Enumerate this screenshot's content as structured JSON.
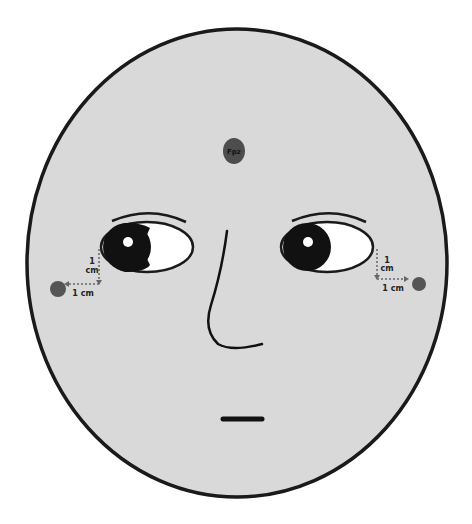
{
  "diagram": {
    "colors": {
      "background": "#ffffff",
      "face_fill": "#d9d9d9",
      "outline": "#1a1a1a",
      "electrode": "#555555",
      "sclera": "#ffffff",
      "iris": "#111111",
      "highlight": "#ffffff",
      "guide_line": "#666666"
    },
    "electrodes": [
      {
        "id": "fpz",
        "label": "Fpz",
        "position": "forehead center"
      },
      {
        "id": "left-outer-canthus",
        "label": "",
        "position": "left of left eye"
      },
      {
        "id": "right-outer-canthus",
        "label": "",
        "position": "right of right eye"
      }
    ],
    "measurements": {
      "left": {
        "vertical": "1",
        "vertical_unit": "cm",
        "horizontal": "1 cm"
      },
      "right": {
        "vertical": "1",
        "vertical_unit": "cm",
        "horizontal": "1 cm"
      }
    }
  }
}
